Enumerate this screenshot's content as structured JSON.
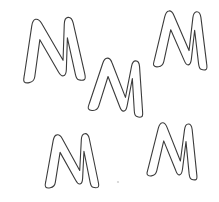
{
  "canvas": {
    "width": 219,
    "height": 202,
    "background_color": "#ffffff",
    "stroke_color": "#3b3b3b",
    "fill_color": "#ffffff",
    "stroke_width": 1.1,
    "description": "Five hand-drawn outline letter M shapes scattered on a white background"
  },
  "shapes": [
    {
      "id": "m-top-left",
      "label": "M",
      "role": "outline-letter",
      "x": 19,
      "y": 17,
      "width": 61,
      "height": 66,
      "center_x": 49.5,
      "center_y": 50.0,
      "rotation_deg": -3,
      "path": "M 8.5 64.5 C 6.6 64.9 4.6 64.6 3.6 63.4 C 2.6 62.2 3.3 60.1 3.9 57.6 L 14.0 8.2 C 14.7 4.6 15.9 2.0 18.2 1.6 C 20.6 1.2 22.6 3.2 24.1 6.2 L 43.5 44.0 L 46.6 8.0 C 46.9 4.1 48.0 1.6 50.6 1.4 C 53.3 1.2 54.9 3.6 55.6 7.3 L 64.4 58.2 C 64.9 61.1 65.2 63.4 63.9 64.3 C 62.6 65.2 60.1 65.0 58.0 64.3 C 56.3 63.7 55.6 61.7 55.1 58.6 L 49.0 21.8 L 46.3 53.4 C 46.0 56.9 45.2 59.2 43.1 59.5 C 41.0 59.8 39.6 57.9 38.2 55.1 L 21.4 22.2 L 14.4 58.9 C 13.8 62.0 12.3 64.0 8.5 64.5 Z"
    },
    {
      "id": "m-center",
      "label": "M",
      "role": "outline-letter",
      "x": 88,
      "y": 58,
      "width": 60,
      "height": 58,
      "center_x": 118.0,
      "center_y": 87.0,
      "rotation_deg": 6,
      "path": "M 7.5 55.0 C 5.6 55.4 3.7 55.0 2.8 53.8 C 1.9 52.6 2.6 50.7 3.2 48.4 L 12.3 7.2 C 13.0 4.0 14.1 1.7 16.2 1.4 C 18.4 1.0 20.2 2.8 21.5 5.5 L 38.5 38.5 L 41.3 7.0 C 41.6 3.5 42.6 1.4 44.9 1.2 C 47.3 1.0 48.7 3.2 49.3 6.5 L 57.0 50.8 C 57.5 53.4 57.8 55.4 56.6 56.2 C 55.4 57.0 53.2 56.8 51.3 56.2 C 49.8 55.7 49.2 53.9 48.7 51.1 L 43.4 19.2 L 41.0 47.0 C 40.7 50.1 40.0 52.1 38.1 52.4 C 36.3 52.7 35.0 51.0 33.8 48.5 L 19.0 19.6 L 12.9 49.8 C 12.4 52.6 11.0 54.5 7.5 55.0 Z"
    },
    {
      "id": "m-top-right",
      "label": "M",
      "role": "outline-letter",
      "x": 152,
      "y": 10,
      "width": 58,
      "height": 60,
      "center_x": 181.0,
      "center_y": 40.0,
      "rotation_deg": 2,
      "path": "M 7.3 57.5 C 5.5 57.9 3.6 57.5 2.7 56.3 C 1.8 55.1 2.5 53.2 3.1 50.8 L 11.9 7.4 C 12.6 4.1 13.7 1.7 15.8 1.4 C 18.0 1.0 19.8 2.9 21.1 5.7 L 37.4 40.3 L 40.1 7.2 C 40.4 3.6 41.4 1.4 43.7 1.2 C 46.1 1.0 47.5 3.3 48.1 6.7 L 55.5 53.0 C 56.0 55.7 56.3 57.8 55.1 58.6 C 53.9 59.4 51.8 59.2 50.0 58.6 C 48.5 58.1 47.9 56.2 47.4 53.3 L 42.3 19.8 L 40.0 49.0 C 39.7 52.2 39.0 54.3 37.2 54.6 C 35.5 54.9 34.2 53.1 33.0 50.5 L 18.4 20.1 L 12.6 52.0 C 12.1 54.9 10.7 57.0 7.3 57.5 Z"
    },
    {
      "id": "m-bottom-left",
      "label": "M",
      "role": "outline-letter",
      "x": 42,
      "y": 133,
      "width": 58,
      "height": 57,
      "center_x": 71.0,
      "center_y": 161.5,
      "rotation_deg": -2,
      "path": "M 7.3 54.0 C 5.5 54.4 3.6 54.1 2.7 52.9 C 1.8 51.7 2.5 49.9 3.1 47.6 L 11.9 7.1 C 12.6 4.0 13.7 1.7 15.8 1.4 C 18.0 1.0 19.8 2.8 21.1 5.4 L 37.4 37.8 L 40.1 6.9 C 40.4 3.5 41.4 1.4 43.7 1.2 C 46.1 1.0 47.5 3.2 48.1 6.4 L 55.5 49.7 C 56.0 52.2 56.3 54.2 55.1 55.0 C 53.9 55.8 51.8 55.6 50.0 55.0 C 48.5 54.5 47.9 52.7 47.4 50.0 L 42.3 18.7 L 40.0 46.0 C 39.7 49.0 39.0 51.0 37.2 51.3 C 35.5 51.6 34.2 49.9 33.0 47.4 L 18.4 19.0 L 12.6 48.8 C 12.1 51.5 10.7 53.5 7.3 54.0 Z"
    },
    {
      "id": "m-bottom-right",
      "label": "M",
      "role": "outline-letter",
      "x": 146,
      "y": 122,
      "width": 54,
      "height": 58,
      "center_x": 173.0,
      "center_y": 151.0,
      "rotation_deg": 3,
      "path": "M 6.8 55.0 C 5.1 55.4 3.3 55.1 2.5 53.9 C 1.7 52.7 2.3 50.9 2.9 48.6 L 11.1 7.2 C 11.8 4.0 12.8 1.7 14.8 1.4 C 16.8 1.0 18.5 2.9 19.7 5.5 L 34.9 38.6 L 37.4 7.0 C 37.7 3.5 38.7 1.4 40.9 1.2 C 43.1 1.0 44.4 3.3 45.0 6.5 L 51.9 50.8 C 52.4 53.4 52.7 55.4 51.6 56.2 C 50.5 57.0 48.5 56.8 46.8 56.2 C 45.4 55.7 44.8 53.8 44.3 51.0 L 39.5 19.0 L 37.4 47.0 C 37.1 50.1 36.4 52.2 34.8 52.5 C 33.1 52.8 31.9 51.0 30.8 48.4 L 17.2 19.4 L 11.8 49.8 C 11.3 52.6 10.0 54.5 6.8 55.0 Z"
    }
  ],
  "artifacts": [
    {
      "id": "speck-1",
      "role": "scan-speck",
      "x": 118,
      "y": 182,
      "radius": 1.1,
      "color": "#d2d2d2"
    }
  ]
}
